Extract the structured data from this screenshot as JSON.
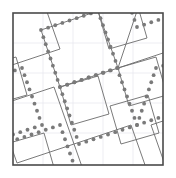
{
  "figure": {
    "canvas": {
      "width": 176,
      "height": 178,
      "background": "#ffffff"
    },
    "frame": {
      "label": "outer-square-frame",
      "x": 13,
      "y": 13,
      "width": 150,
      "height": 152,
      "stroke": "#4a4a4a",
      "stroke_width": 1.6,
      "fill": "none"
    },
    "grid": {
      "label": "faint-background-grid",
      "stroke": "#e9e9ef",
      "stroke_width": 0.8,
      "spacing": 30,
      "x_lines": [
        43,
        73,
        103,
        133
      ],
      "y_lines": [
        43,
        73,
        103,
        133
      ],
      "visible": true
    },
    "tiling": {
      "label": "pythagorean-square-tiling",
      "stroke": "#6b6b6b",
      "stroke_width": 0.9,
      "fill": "none",
      "rotation_deg": -17,
      "large_square_side": 62,
      "small_square_side": 38,
      "polygons": [
        {
          "name": "large-square-top-left",
          "size": "large",
          "points": "41,30 98,11 118,68 60,87"
        },
        {
          "name": "large-square-top-right",
          "size": "large",
          "points": "118,68 137,11 194,-8 175,49"
        },
        {
          "name": "small-square-upper-right",
          "size": "small",
          "points": "118,68 156,57 167,95 129,106"
        },
        {
          "name": "large-square-mid-left",
          "size": "large",
          "points": "-3,106 54,87 74,144 17,163"
        },
        {
          "name": "small-square-left-edge",
          "size": "small",
          "points": "-22,68 16,57 27,95 -11,106"
        },
        {
          "name": "large-square-bottom-mid",
          "size": "large",
          "points": "74,144 131,125 151,182 94,201"
        },
        {
          "name": "small-square-lower-mid",
          "size": "small",
          "points": "110,106 148,95 159,133 121,144"
        },
        {
          "name": "small-square-center",
          "size": "small",
          "points": "60,87 98,76 109,114 71,125"
        },
        {
          "name": "large-square-top-far-left",
          "size": "large",
          "points": "-17,11 40,-8 60,49 3,68"
        },
        {
          "name": "small-square-top-mid",
          "size": "small",
          "points": "98,11 136,0 147,38 109,49"
        },
        {
          "name": "small-square-bottom-left",
          "size": "small",
          "points": "6,144 44,133 55,171 17,182"
        },
        {
          "name": "large-square-bottom-right",
          "size": "large",
          "points": "151,125 208,106 228,163 171,182"
        }
      ]
    },
    "dotted_lattice": {
      "label": "dotted-square-lattice-overlay",
      "dot_color": "#7a7a7a",
      "dot_radius": 1.9,
      "dot_spacing": 7.6,
      "square_side": 62,
      "rotation_deg": -17,
      "origin": {
        "x": 60,
        "y": 87
      },
      "squares": [
        {
          "name": "dotted-square-center",
          "points": "60,87 117,68 137,125 79,144"
        },
        {
          "name": "dotted-square-upper-left",
          "points": "41,30 98,11 118,68 60,87"
        },
        {
          "name": "dotted-square-upper-right",
          "points": "137,125 156,68 213,49 194,106"
        },
        {
          "name": "dotted-square-lower-left",
          "points": "3,144 60,125 80,182 23,201"
        },
        {
          "name": "dotted-square-far-left",
          "points": "-35,87 22,68 42,125 -16,144"
        },
        {
          "name": "dotted-square-far-top",
          "points": "117,-30 174,-49 194,8 137,27"
        },
        {
          "name": "dotted-square-lower-right",
          "points": "117,182 174,163 194,220 137,239"
        }
      ]
    }
  }
}
